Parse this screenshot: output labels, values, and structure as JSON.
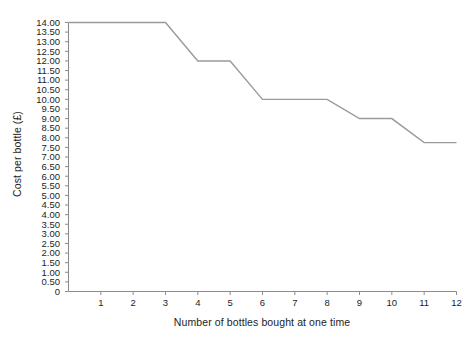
{
  "chart_data": {
    "type": "line",
    "title": "",
    "xlabel": "Number of bottles bought at one time",
    "ylabel": "Cost per bottle (£)",
    "x": [
      0,
      3,
      4,
      5,
      6,
      8,
      9,
      10,
      11,
      12
    ],
    "values": [
      14.0,
      14.0,
      12.0,
      12.0,
      10.0,
      10.0,
      9.0,
      9.0,
      7.75,
      7.75
    ],
    "series": [
      {
        "name": "Cost per bottle",
        "points": [
          {
            "x": 0,
            "y": 14.0
          },
          {
            "x": 3,
            "y": 14.0
          },
          {
            "x": 4,
            "y": 12.0
          },
          {
            "x": 5,
            "y": 12.0
          },
          {
            "x": 6,
            "y": 10.0
          },
          {
            "x": 8,
            "y": 10.0
          },
          {
            "x": 9,
            "y": 9.0
          },
          {
            "x": 10,
            "y": 9.0
          },
          {
            "x": 11,
            "y": 7.75
          },
          {
            "x": 12,
            "y": 7.75
          }
        ],
        "color": "#9a9a9a"
      }
    ],
    "xlim": [
      0,
      12
    ],
    "ylim": [
      0,
      14
    ],
    "grid": false,
    "legend": false,
    "legend_position": "none",
    "x_tick_labels": [
      "1",
      "2",
      "3",
      "4",
      "5",
      "6",
      "7",
      "8",
      "9",
      "10",
      "11",
      "12"
    ],
    "x_tick_values": [
      1,
      2,
      3,
      4,
      5,
      6,
      7,
      8,
      9,
      10,
      11,
      12
    ],
    "y_tick_labels": [
      "14.00",
      "13.50",
      "13.00",
      "12.50",
      "12.00",
      "11.50",
      "11.00",
      "10.50",
      "10.00",
      "9.50",
      "9.00",
      "8.50",
      "8.00",
      "7.50",
      "7.00",
      "6.50",
      "6.00",
      "5.50",
      "5.00",
      "4.50",
      "4.00",
      "3.50",
      "3.00",
      "2.50",
      "2.00",
      "1.50",
      "1.00",
      "0.50",
      "0"
    ],
    "y_tick_values": [
      14.0,
      13.5,
      13.0,
      12.5,
      12.0,
      11.5,
      11.0,
      10.5,
      10.0,
      9.5,
      9.0,
      8.5,
      8.0,
      7.5,
      7.0,
      6.5,
      6.0,
      5.5,
      5.0,
      4.5,
      4.0,
      3.5,
      3.0,
      2.5,
      2.0,
      1.5,
      1.0,
      0.5,
      0.0
    ],
    "axis_color": "#8c8c8c",
    "line_color": "#9a9a9a",
    "background_color": "#ffffff"
  }
}
